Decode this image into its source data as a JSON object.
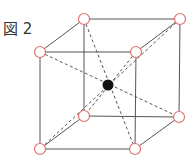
{
  "figure": {
    "label": "図 2",
    "colors": {
      "edge": "#555555",
      "diagonal": "#555555",
      "corner_atom_stroke": "#e07070",
      "corner_atom_fill": "#ffffff",
      "center_atom_fill": "#111111"
    },
    "corner_atoms": [
      {
        "name": "back-top-left",
        "x": 84,
        "y": 19
      },
      {
        "name": "back-top-right",
        "x": 180,
        "y": 19
      },
      {
        "name": "front-top-left",
        "x": 40,
        "y": 52
      },
      {
        "name": "front-top-right",
        "x": 136,
        "y": 52
      },
      {
        "name": "back-bottom-left",
        "x": 84,
        "y": 116
      },
      {
        "name": "back-bottom-right",
        "x": 179,
        "y": 117
      },
      {
        "name": "front-bottom-left",
        "x": 40,
        "y": 149
      },
      {
        "name": "front-bottom-right",
        "x": 135,
        "y": 149
      }
    ],
    "center_atom": {
      "x": 108,
      "y": 85
    }
  }
}
